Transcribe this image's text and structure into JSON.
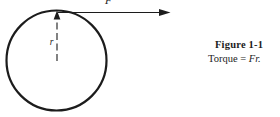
{
  "figure": {
    "label": "Figure 1-1",
    "caption_prefix": "Torque = ",
    "caption_math": "Fr."
  },
  "diagram": {
    "shape": "circle",
    "radius_label": "r",
    "force_label": "F"
  },
  "colors": {
    "ink": "#1c1c1c",
    "background": "#ffffff"
  }
}
